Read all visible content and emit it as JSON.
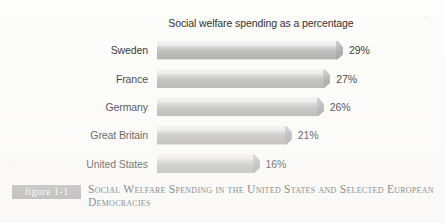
{
  "figure": {
    "badge_label": "figure 1-1",
    "caption": "Social Welfare Spending in the United States and Selected European Democracies",
    "badge_color": "#9b9b9b",
    "caption_color": "#2a2a2a"
  },
  "chart_data": {
    "type": "bar",
    "orientation": "horizontal",
    "title": "Social welfare spending as a percentage\nof Gross Domestic Product (GDP)",
    "title_line_1": "Social welfare spending as a percentage",
    "title_line_2": "of Gross Domestic Product (GDP)",
    "xlabel": "",
    "ylabel": "",
    "xlim": [
      0,
      29
    ],
    "grid": false,
    "legend": false,
    "bar_color": "#bcbcbc",
    "categories": [
      "Sweden",
      "France",
      "Germany",
      "Great Britain",
      "United States"
    ],
    "values": [
      29,
      27,
      26,
      21,
      16
    ],
    "value_labels": [
      "29%",
      "27%",
      "26%",
      "21%",
      "16%"
    ],
    "points": [
      {
        "category": "Sweden",
        "value": 29,
        "label": "29%"
      },
      {
        "category": "France",
        "value": 27,
        "label": "27%"
      },
      {
        "category": "Germany",
        "value": 26,
        "label": "26%"
      },
      {
        "category": "Great Britain",
        "value": 21,
        "label": "21%"
      },
      {
        "category": "United States",
        "value": 16,
        "label": "16%"
      }
    ]
  }
}
